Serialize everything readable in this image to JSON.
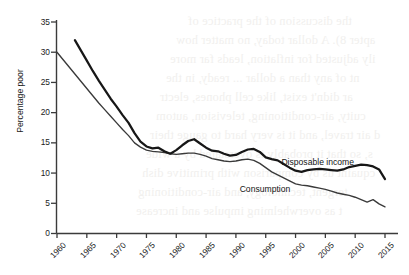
{
  "chart_data": {
    "type": "line",
    "title": "",
    "xlabel": "",
    "ylabel": "Percentage poor",
    "xlim": [
      1960,
      2016
    ],
    "ylim": [
      0,
      35
    ],
    "xticks": [
      "1960",
      "1965",
      "1970",
      "1975",
      "1980",
      "1985",
      "1990",
      "1995",
      "2000",
      "2005",
      "2010",
      "2015"
    ],
    "yticks": [
      "0",
      "5",
      "10",
      "15",
      "20",
      "25",
      "30",
      "35"
    ],
    "grid": false,
    "legend_position": "inline-annotations",
    "series": [
      {
        "name": "Disposable income",
        "style": "thick",
        "x": [
          1963,
          1964,
          1965,
          1966,
          1967,
          1968,
          1969,
          1970,
          1971,
          1972,
          1973,
          1974,
          1975,
          1976,
          1977,
          1978,
          1979,
          1980,
          1981,
          1982,
          1983,
          1984,
          1985,
          1986,
          1987,
          1988,
          1989,
          1990,
          1991,
          1992,
          1993,
          1994,
          1995,
          1996,
          1997,
          1998,
          1999,
          2000,
          2001,
          2002,
          2003,
          2004,
          2005,
          2006,
          2007,
          2008,
          2009,
          2010,
          2011,
          2012,
          2013,
          2014,
          2015
        ],
        "values": [
          32.0,
          30.3,
          28.6,
          26.9,
          25.3,
          23.8,
          22.3,
          21.0,
          19.6,
          18.3,
          16.6,
          15.2,
          14.4,
          14.1,
          14.2,
          13.6,
          13.2,
          13.8,
          14.6,
          15.3,
          15.6,
          14.9,
          14.2,
          13.7,
          13.6,
          13.2,
          12.9,
          13.0,
          13.5,
          13.9,
          14.0,
          13.5,
          12.6,
          12.3,
          12.1,
          11.5,
          10.9,
          10.4,
          10.2,
          10.5,
          10.6,
          10.7,
          10.6,
          10.5,
          10.4,
          10.6,
          11.0,
          11.2,
          11.4,
          11.3,
          11.1,
          10.6,
          9.0
        ]
      },
      {
        "name": "Consumption",
        "style": "thin",
        "x": [
          1960,
          1961,
          1962,
          1963,
          1964,
          1965,
          1966,
          1967,
          1968,
          1969,
          1970,
          1971,
          1972,
          1973,
          1974,
          1975,
          1976,
          1977,
          1978,
          1979,
          1980,
          1981,
          1982,
          1983,
          1984,
          1985,
          1986,
          1987,
          1988,
          1989,
          1990,
          1991,
          1992,
          1993,
          1994,
          1995,
          1996,
          1997,
          1998,
          1999,
          2000,
          2001,
          2002,
          2003,
          2004,
          2005,
          2006,
          2007,
          2008,
          2009,
          2010,
          2011,
          2012,
          2013,
          2014,
          2015
        ],
        "values": [
          30.0,
          28.8,
          27.6,
          26.4,
          25.2,
          24.0,
          22.8,
          21.6,
          20.5,
          19.4,
          18.3,
          17.2,
          16.2,
          15.0,
          14.3,
          13.8,
          13.6,
          13.5,
          13.4,
          13.2,
          13.1,
          13.2,
          13.3,
          13.3,
          13.1,
          12.8,
          12.4,
          12.2,
          12.0,
          11.9,
          12.0,
          12.2,
          12.3,
          12.1,
          11.6,
          10.9,
          10.2,
          9.7,
          9.2,
          8.7,
          8.2,
          8.0,
          7.9,
          7.7,
          7.5,
          7.3,
          7.0,
          6.7,
          6.5,
          6.3,
          6.0,
          5.6,
          5.2,
          5.6,
          4.9,
          4.4
        ]
      }
    ],
    "annotations": [
      {
        "text": "Disposable income",
        "x": 2004,
        "y": 11.6
      },
      {
        "text": "Consumption",
        "x": 1997,
        "y": 7.2
      }
    ]
  },
  "background_showthrough": {
    "description": "faint mirrored text bleeding through from the reverse page",
    "lines": [
      "the discussion of the practice of",
      "apter 8). A dollar today, no matter how",
      "ily adjusted for inflation, leads far more",
      "nt of any than a dollar ... ready, in the",
      "ar didn't exist, like cell phones, electr",
      "cuity, air-conditioning, television, autom",
      "d air travel, and it is very hard to gauge their",
      "s, so that it probably is overstated by a wide",
      "cquaint us by comparison with primitive dish",
      "tergent, technology, and air-conditioning",
      "t as overwhelming impulse and increase"
    ]
  }
}
